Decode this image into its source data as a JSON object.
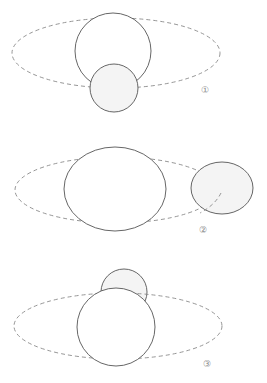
{
  "figure": {
    "panels": [
      {
        "id": 1,
        "label": "①",
        "description": "Small circle in front of large circle, below orbit center"
      },
      {
        "id": 2,
        "label": "②",
        "description": "Small circle to the right on orbit, separated from large circle"
      },
      {
        "id": 3,
        "label": "③",
        "description": "Small circle behind large circle, above orbit"
      }
    ],
    "colors": {
      "stroke": "#555555",
      "orbit": "#8a8a8a",
      "background": "#ffffff"
    }
  }
}
